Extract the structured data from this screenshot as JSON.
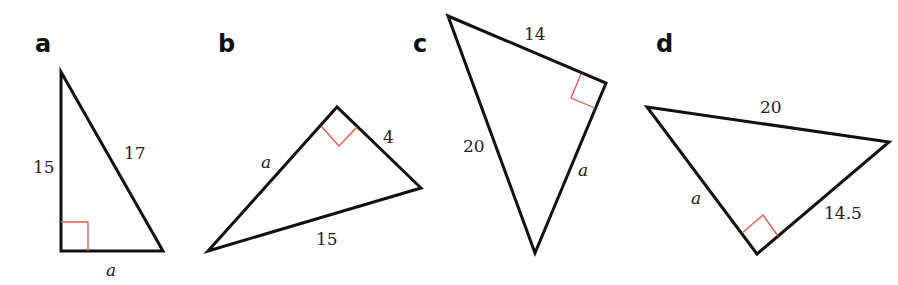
{
  "colors": {
    "stroke": "#111111",
    "right_angle_marker": "#e0574a",
    "background": "#ffffff"
  },
  "triangles": [
    {
      "label": "a",
      "sides": {
        "vertical_leg": "15",
        "hypotenuse": "17",
        "base_leg": "a"
      }
    },
    {
      "label": "b",
      "sides": {
        "left_leg": "a",
        "right_leg": "4",
        "hypotenuse": "15"
      }
    },
    {
      "label": "c",
      "sides": {
        "top_leg": "14",
        "hypotenuse": "20",
        "right_leg": "a"
      }
    },
    {
      "label": "d",
      "sides": {
        "hypotenuse": "20",
        "left_leg": "a",
        "right_leg": "14.5"
      }
    }
  ]
}
